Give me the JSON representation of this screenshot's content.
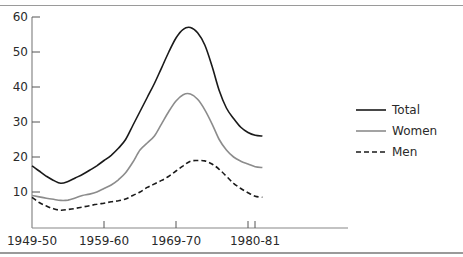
{
  "chart_data": {
    "type": "line",
    "title": "",
    "xlabel": "",
    "ylabel": "",
    "ylim": [
      0,
      60
    ],
    "yticks": [
      10,
      20,
      30,
      40,
      50,
      60
    ],
    "xtick_labels": [
      "1949-50",
      "1959-60",
      "1969-70",
      "1980-81"
    ],
    "xtick_positions": [
      1949,
      1959,
      1969,
      1980
    ],
    "grid": false,
    "legend_position": "right",
    "x": [
      1949,
      1950,
      1951,
      1952,
      1953,
      1954,
      1955,
      1956,
      1957,
      1958,
      1959,
      1960,
      1961,
      1962,
      1963,
      1964,
      1965,
      1966,
      1967,
      1968,
      1969,
      1970,
      1971,
      1972,
      1973,
      1974,
      1975,
      1976,
      1977,
      1978,
      1979,
      1980,
      1981
    ],
    "series": [
      {
        "name": "Total",
        "style": "solid",
        "color": "#1a1a1a",
        "values": [
          17.5,
          16,
          14.5,
          13.3,
          12.5,
          13,
          14,
          15,
          16.2,
          17.5,
          19,
          20.5,
          22.5,
          25,
          29,
          33,
          37,
          41,
          45.5,
          50,
          54,
          56.5,
          57,
          55.5,
          52,
          46,
          39,
          34,
          31,
          28.5,
          27,
          26.2,
          26
        ]
      },
      {
        "name": "Women",
        "style": "solid",
        "color": "#8c8c8c",
        "values": [
          9,
          8.6,
          8.2,
          7.9,
          7.6,
          7.7,
          8.3,
          9,
          9.4,
          10,
          11,
          12,
          13.5,
          15.5,
          18.5,
          22,
          24,
          26,
          29.5,
          33,
          36,
          37.8,
          38,
          36.5,
          33.5,
          29.5,
          25,
          22,
          20,
          18.8,
          18,
          17.2,
          17
        ]
      },
      {
        "name": "Men",
        "style": "dashed",
        "color": "#1a1a1a",
        "values": [
          8.5,
          7,
          6,
          5.2,
          4.8,
          5,
          5.3,
          5.7,
          6.1,
          6.5,
          6.8,
          7.2,
          7.5,
          8,
          9,
          10,
          11.3,
          12.3,
          13.3,
          14.5,
          16,
          17.5,
          18.8,
          19,
          18.9,
          18,
          16.5,
          14.5,
          12.5,
          11,
          9.8,
          8.8,
          8.5
        ]
      }
    ]
  },
  "legend": {
    "items": [
      {
        "label": "Total"
      },
      {
        "label": "Women"
      },
      {
        "label": "Men"
      }
    ]
  },
  "axes": {
    "y_labels": [
      "60",
      "50",
      "40",
      "30",
      "20",
      "10"
    ],
    "x_labels": [
      "1949-50",
      "1959-60",
      "1969-70",
      "1980-81"
    ]
  }
}
